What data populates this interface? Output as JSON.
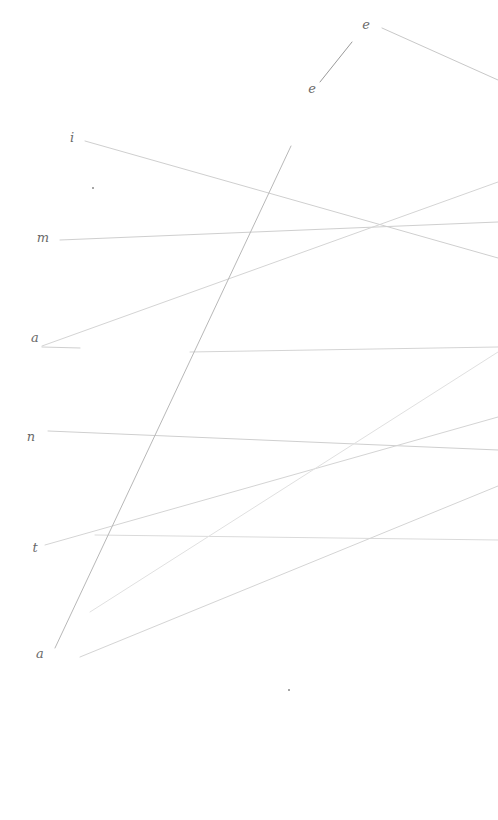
{
  "canvas": {
    "width": 498,
    "height": 820,
    "background": "#ffffff"
  },
  "labels": [
    {
      "text": "e",
      "x": 366,
      "y": 24
    },
    {
      "text": "e",
      "x": 312,
      "y": 88
    },
    {
      "text": "i",
      "x": 72,
      "y": 137
    },
    {
      "text": "m",
      "x": 43,
      "y": 237
    },
    {
      "text": "a",
      "x": 35,
      "y": 337
    },
    {
      "text": "n",
      "x": 31,
      "y": 436
    },
    {
      "text": "t",
      "x": 35,
      "y": 547
    },
    {
      "text": "a",
      "x": 40,
      "y": 653
    }
  ],
  "lines": [
    {
      "x1": 382,
      "y1": 28,
      "x2": 498,
      "y2": 80,
      "color": "#c8c8c8"
    },
    {
      "x1": 352,
      "y1": 42,
      "x2": 320,
      "y2": 82,
      "color": "#9a9a9a"
    },
    {
      "x1": 85,
      "y1": 141,
      "x2": 498,
      "y2": 258,
      "color": "#cfcfcf"
    },
    {
      "x1": 60,
      "y1": 240,
      "x2": 498,
      "y2": 222,
      "color": "#cfcfcf"
    },
    {
      "x1": 42,
      "y1": 346,
      "x2": 498,
      "y2": 182,
      "color": "#d4d4d4"
    },
    {
      "x1": 42,
      "y1": 347,
      "x2": 80,
      "y2": 348,
      "color": "#cfcfcf"
    },
    {
      "x1": 190,
      "y1": 352,
      "x2": 498,
      "y2": 347,
      "color": "#d4d4d4"
    },
    {
      "x1": 48,
      "y1": 431,
      "x2": 498,
      "y2": 450,
      "color": "#cfcfcf"
    },
    {
      "x1": 45,
      "y1": 545,
      "x2": 498,
      "y2": 417,
      "color": "#d4d4d4"
    },
    {
      "x1": 95,
      "y1": 535,
      "x2": 498,
      "y2": 540,
      "color": "#dadada"
    },
    {
      "x1": 90,
      "y1": 612,
      "x2": 498,
      "y2": 352,
      "color": "#e0e0e0"
    },
    {
      "x1": 80,
      "y1": 657,
      "x2": 498,
      "y2": 486,
      "color": "#d4d4d4"
    },
    {
      "x1": 55,
      "y1": 648,
      "x2": 291,
      "y2": 146,
      "color": "#b8b8b8"
    }
  ],
  "dots": [
    {
      "x": 92,
      "y": 187
    },
    {
      "x": 288,
      "y": 689
    }
  ]
}
